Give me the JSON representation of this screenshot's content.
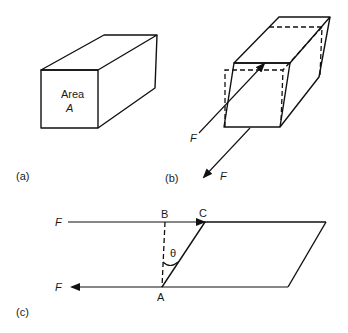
{
  "figure": {
    "panels": [
      {
        "id": "a",
        "label": "(a)",
        "description": "Rectangular block with cross-sectional area",
        "face_label_line1": "Area",
        "face_label_line2": "A"
      },
      {
        "id": "b",
        "label": "(b)",
        "description": "Block deformed by shear forces",
        "force_upper": "F",
        "force_lower": "F"
      },
      {
        "id": "c",
        "label": "(c)",
        "description": "Side view of sheared block showing shear angle",
        "force_top": "F",
        "force_bottom": "F",
        "point_a": "A",
        "point_b": "B",
        "point_c": "C",
        "angle": "θ"
      }
    ]
  }
}
